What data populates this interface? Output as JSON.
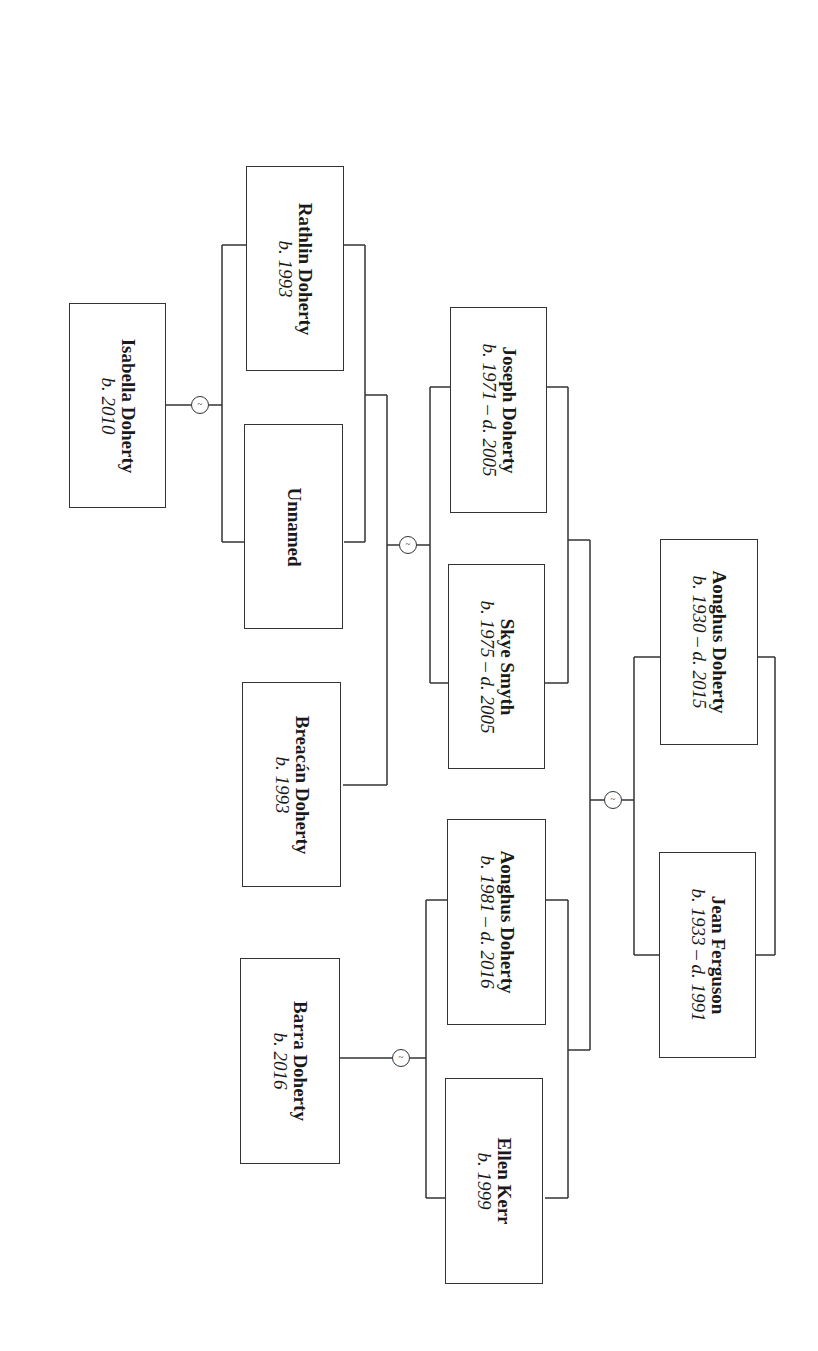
{
  "diagram": {
    "type": "family-tree",
    "orientation": "rotated-90",
    "people": [
      {
        "id": "isabella",
        "name": "Isabella Doherty",
        "dates": "b. 2010"
      },
      {
        "id": "rathlin",
        "name": "Rathlin Doherty",
        "dates": "b. 1993"
      },
      {
        "id": "unnamed",
        "name": "Unnamed",
        "dates": ""
      },
      {
        "id": "breacan",
        "name": "Breacán Doherty",
        "dates": "b. 1993"
      },
      {
        "id": "barra",
        "name": "Barra Doherty",
        "dates": "b. 2016"
      },
      {
        "id": "joseph",
        "name": "Joseph Doherty",
        "dates": "b. 1971 – d. 2005"
      },
      {
        "id": "skye",
        "name": "Skye Smyth",
        "dates": "b. 1975 – d. 2005"
      },
      {
        "id": "aonghus_jr",
        "name": "Aonghus Doherty",
        "dates": "b. 1981 – d. 2016"
      },
      {
        "id": "ellen",
        "name": "Ellen Kerr",
        "dates": "b. 1999"
      },
      {
        "id": "aonghus_sr",
        "name": "Aonghus Doherty",
        "dates": "b. 1930 – d. 2015"
      },
      {
        "id": "jean",
        "name": "Jean Ferguson",
        "dates": "b. 1933 – d. 1991"
      }
    ],
    "unions": [
      {
        "partners": [
          "rathlin",
          "unnamed"
        ],
        "children": [
          "isabella"
        ],
        "marker": "~"
      },
      {
        "partners": [
          "joseph",
          "skye"
        ],
        "children": [
          "rathlin",
          "breacan"
        ],
        "marker": "~"
      },
      {
        "partners": [
          "aonghus_jr",
          "ellen"
        ],
        "children": [
          "barra"
        ],
        "marker": "~"
      },
      {
        "partners": [
          "aonghus_sr",
          "jean"
        ],
        "children": [
          "joseph",
          "aonghus_jr"
        ],
        "marker": "~"
      }
    ],
    "marker_symbol": "~"
  }
}
